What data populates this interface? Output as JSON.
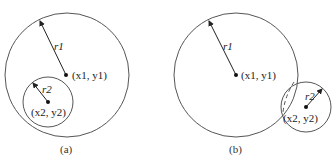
{
  "figure": {
    "panels": [
      {
        "caption": "(a)",
        "big_circle": {
          "center_label": "(x1, y1)",
          "radius_label": "r1"
        },
        "small_circle": {
          "center_label": "(x2, y2)",
          "radius_label": "r2"
        },
        "relation": "small circle inside big circle"
      },
      {
        "caption": "(b)",
        "big_circle": {
          "center_label": "(x1, y1)",
          "radius_label": "r1"
        },
        "small_circle": {
          "center_label": "(x2, y2)",
          "radius_label": "r2"
        },
        "relation": "circles overlap"
      }
    ]
  },
  "colors": {
    "stroke": "#555555",
    "text": "#222222",
    "background": "#ffffff"
  }
}
